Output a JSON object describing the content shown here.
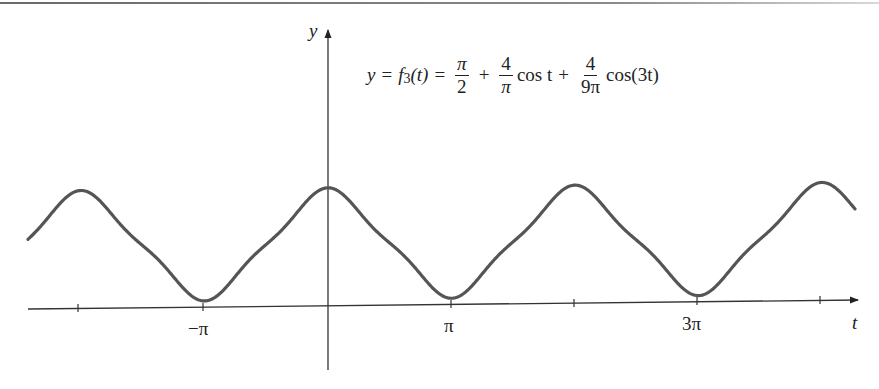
{
  "chart_data": {
    "type": "line",
    "xlabel": "t",
    "ylabel": "y",
    "x_tick_labels": [
      "−π",
      "π",
      "3π"
    ],
    "x_ticks": [
      "-2π",
      "-π",
      "0",
      "π",
      "2π",
      "3π",
      "4π"
    ],
    "xlim": [
      "-2.6π",
      "4.2π"
    ],
    "ylim": [
      0,
      3.0
    ],
    "grid": false,
    "series": [
      {
        "name": "f3(t)",
        "color": "#555555",
        "x": [
          "-2π",
          "-3π/2",
          "-π",
          "-π/2",
          "0",
          "π/2",
          "π",
          "3π/2",
          "2π",
          "5π/2",
          "3π",
          "7π/2",
          "4π"
        ],
        "values": [
          2.985,
          1.571,
          0.156,
          1.571,
          2.985,
          1.571,
          0.156,
          1.571,
          2.985,
          1.571,
          0.156,
          1.571,
          2.985
        ]
      }
    ]
  },
  "formula": {
    "lhs": "y",
    "eq1": "=",
    "fname": "f",
    "fsub": "3",
    "farg": "(t)",
    "eq2": "=",
    "frac1_num": "π",
    "frac1_den": "2",
    "plus1": "+",
    "frac2_num": "4",
    "frac2_den": "π",
    "term2": "cos t",
    "plus2": "+",
    "frac3_num": "4",
    "frac3_den": "9π",
    "term3": "cos(3t)"
  },
  "axes": {
    "y_label": "y",
    "t_label": "t",
    "tick_neg_pi": "−π",
    "tick_pi": "π",
    "tick_3pi": "3π"
  },
  "colors": {
    "curve": "#555555",
    "axis": "#333333"
  }
}
